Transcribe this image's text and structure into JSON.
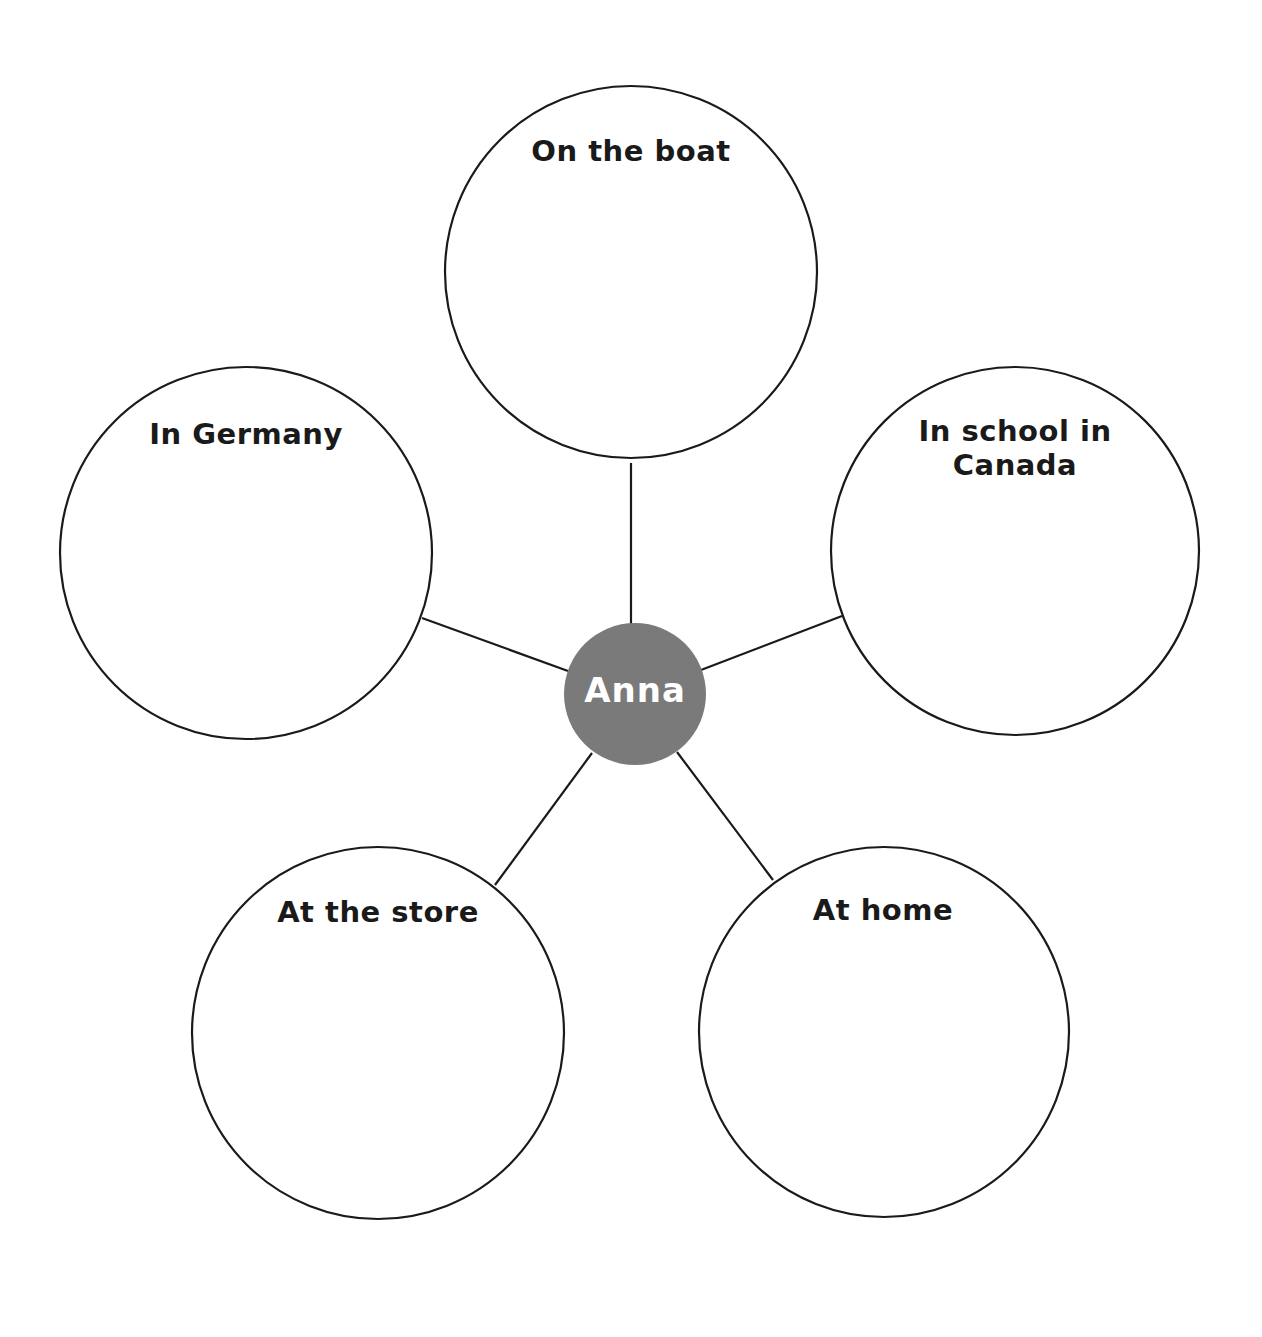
{
  "diagram": {
    "type": "character-web",
    "line_color": "#1a1a1a",
    "bubble_fill": "#ffffff",
    "center": {
      "label": "Anna",
      "fill": "#7a7a7a",
      "text_color": "#ffffff",
      "cx": 635,
      "cy": 694,
      "r": 70
    },
    "nodes": [
      {
        "id": "top",
        "label": "On the boat",
        "cx": 631,
        "cy": 272,
        "r": 186
      },
      {
        "id": "left",
        "label": "In Germany",
        "cx": 246,
        "cy": 553,
        "r": 186
      },
      {
        "id": "right",
        "label": "In school in\nCanada",
        "label_line1": "In school in",
        "label_line2": "Canada",
        "cx": 1015,
        "cy": 551,
        "r": 184
      },
      {
        "id": "bottom-left",
        "label": "At the store",
        "cx": 378,
        "cy": 1033,
        "r": 186
      },
      {
        "id": "bottom-right",
        "label": "At home",
        "cx": 884,
        "cy": 1032,
        "r": 185
      }
    ],
    "connectors": [
      {
        "to": "top",
        "x1": 631,
        "y1": 463,
        "x2": 631,
        "y2": 624
      },
      {
        "to": "left",
        "x1": 422,
        "y1": 618,
        "x2": 568,
        "y2": 671
      },
      {
        "to": "right",
        "x1": 842,
        "y1": 616,
        "x2": 701,
        "y2": 670
      },
      {
        "to": "bottom-left",
        "x1": 495,
        "y1": 885,
        "x2": 592,
        "y2": 753
      },
      {
        "to": "bottom-right",
        "x1": 773,
        "y1": 880,
        "x2": 677,
        "y2": 752
      }
    ]
  }
}
